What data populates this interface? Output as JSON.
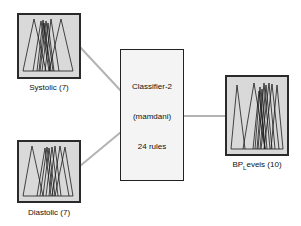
{
  "diagram": {
    "inputs": [
      {
        "name": "Systolic",
        "label": "Systolic (7)",
        "mf_count": 7
      },
      {
        "name": "Diastolic",
        "label": "Diastolic (7)",
        "mf_count": 7
      }
    ],
    "system": {
      "name": "Classifier-2",
      "type": "(mamdani)",
      "rules": "24 rules"
    },
    "outputs": [
      {
        "name": "BP_Levels",
        "label_main": "BP",
        "label_sub": "L",
        "label_rest": "evels (10)",
        "mf_count": 10
      }
    ],
    "colors": {
      "mf_background": "#d9d9d9",
      "mf_border": "#2a2a2a",
      "connector": "#b3b3b3",
      "system_background": "#f4f4f4"
    }
  }
}
